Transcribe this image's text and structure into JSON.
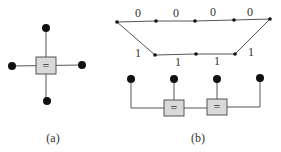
{
  "panel_a": {
    "caption": "(a)",
    "box_symbol": "="
  },
  "panel_b": {
    "caption": "(b)",
    "top_edge_labels": [
      "0",
      "0",
      "0",
      "0"
    ],
    "bottom_edge_labels": [
      "1",
      "1",
      "1",
      "1"
    ],
    "box_symbols": [
      "=",
      "="
    ]
  },
  "colors": {
    "box_fill": "#d9d9d9",
    "line": "#555555",
    "node": "#111111"
  }
}
